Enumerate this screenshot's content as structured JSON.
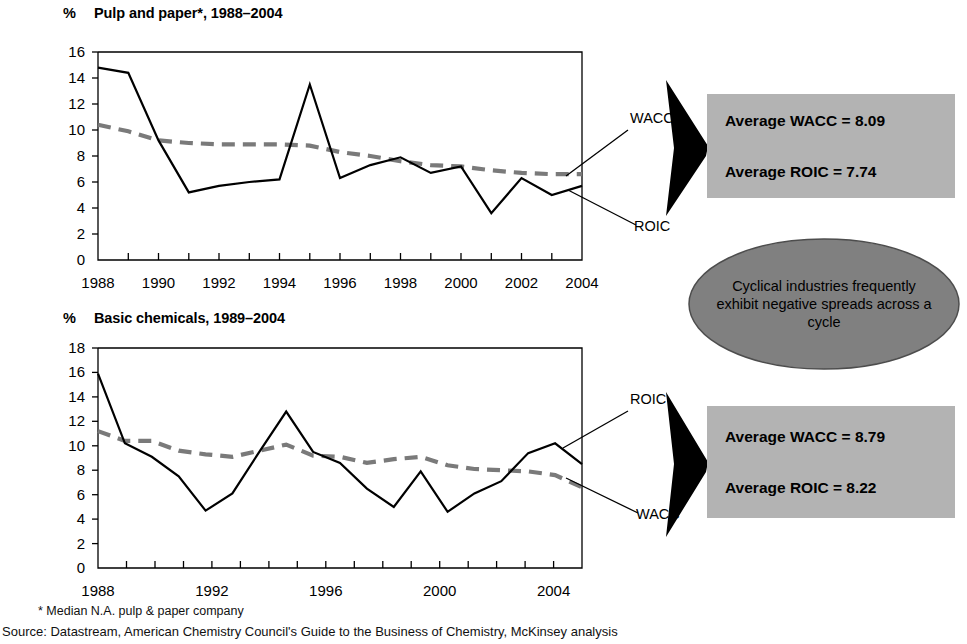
{
  "charts": [
    {
      "id": "pulp-and-paper",
      "percent_symbol": "%",
      "title": "Pulp and paper*, 1988–2004",
      "series_labels": {
        "wacc": "WACC",
        "roic": "ROIC"
      },
      "yticks": [
        "0",
        "2",
        "4",
        "6",
        "8",
        "10",
        "12",
        "14",
        "16"
      ],
      "xticks": [
        "1988",
        "1990",
        "1992",
        "1994",
        "1996",
        "1998",
        "2000",
        "2002",
        "2004"
      ]
    },
    {
      "id": "basic-chemicals",
      "percent_symbol": "%",
      "title": "Basic chemicals, 1989–2004",
      "series_labels": {
        "roic": "ROIC",
        "wacc": "WACC"
      },
      "yticks": [
        "0",
        "2",
        "4",
        "6",
        "8",
        "10",
        "12",
        "14",
        "16",
        "18"
      ],
      "xticks": [
        "1988",
        "1992",
        "1996",
        "2000",
        "2004"
      ]
    }
  ],
  "info_boxes": [
    {
      "id": "pulp-averages",
      "wacc_line": "Average WACC = 8.09",
      "roic_line": "Average ROIC = 7.74"
    },
    {
      "id": "chemicals-averages",
      "wacc_line": "Average WACC = 8.79",
      "roic_line": "Average ROIC = 8.22"
    }
  ],
  "callout": {
    "text": "Cyclical industries frequently exhibit negative spreads across a cycle"
  },
  "footnote": "* Median N.A. pulp & paper company",
  "source": "Source: Datastream, American Chemistry Council's Guide to the Business of Chemistry, McKinsey analysis",
  "colors": {
    "roic_stroke": "#000000",
    "wacc_stroke": "#7a7a7a",
    "box_fill": "#b3b3b3",
    "ellipse_fill": "#808080",
    "arrow_fill": "#000000"
  },
  "chart_data": [
    {
      "type": "line",
      "title": "Pulp and paper*, 1988–2004",
      "xlabel": "",
      "ylabel": "%",
      "ylim": [
        0,
        16
      ],
      "ytick_step": 2,
      "grid": false,
      "legend": "inline annotations at right",
      "x": [
        1988,
        1989,
        1990,
        1991,
        1992,
        1993,
        1994,
        1995,
        1996,
        1997,
        1998,
        1999,
        2000,
        2001,
        2002,
        2003,
        2004
      ],
      "series": [
        {
          "name": "ROIC",
          "style": "solid-black",
          "values": [
            14.8,
            14.4,
            9.2,
            5.2,
            5.7,
            6.0,
            6.2,
            13.5,
            6.3,
            7.3,
            7.9,
            6.7,
            7.2,
            3.6,
            6.3,
            5.0,
            5.7
          ]
        },
        {
          "name": "WACC",
          "style": "dashed-grey",
          "values": [
            10.4,
            9.9,
            9.2,
            9.0,
            8.9,
            8.9,
            8.9,
            8.8,
            8.3,
            8.0,
            7.6,
            7.3,
            7.2,
            6.9,
            6.7,
            6.6,
            6.6
          ]
        }
      ],
      "annotations": [
        {
          "text": "Average WACC = 8.09"
        },
        {
          "text": "Average ROIC = 7.74"
        }
      ]
    },
    {
      "type": "line",
      "title": "Basic chemicals, 1989–2004",
      "xlabel": "",
      "ylabel": "%",
      "ylim": [
        0,
        18
      ],
      "ytick_step": 2,
      "grid": false,
      "legend": "inline annotations at right",
      "x": [
        1988,
        1989,
        1990,
        1991,
        1992,
        1993,
        1994,
        1995,
        1996,
        1997,
        1998,
        1999,
        2000,
        2001,
        2002,
        2003,
        2004,
        2005
      ],
      "series": [
        {
          "name": "ROIC",
          "style": "solid-black",
          "values": [
            15.9,
            10.2,
            9.1,
            7.5,
            4.7,
            6.1,
            9.5,
            12.8,
            9.5,
            8.6,
            6.5,
            5.0,
            7.9,
            4.6,
            6.1,
            7.1,
            9.4,
            10.2,
            8.5
          ]
        },
        {
          "name": "WACC",
          "style": "dashed-grey",
          "values": [
            11.2,
            10.4,
            10.4,
            9.6,
            9.3,
            9.1,
            9.6,
            10.1,
            9.2,
            9.1,
            8.6,
            8.9,
            9.1,
            8.4,
            8.1,
            8.0,
            7.9,
            7.6,
            6.6
          ]
        }
      ],
      "annotations": [
        {
          "text": "Average WACC = 8.79"
        },
        {
          "text": "Average ROIC = 8.22"
        }
      ]
    }
  ]
}
